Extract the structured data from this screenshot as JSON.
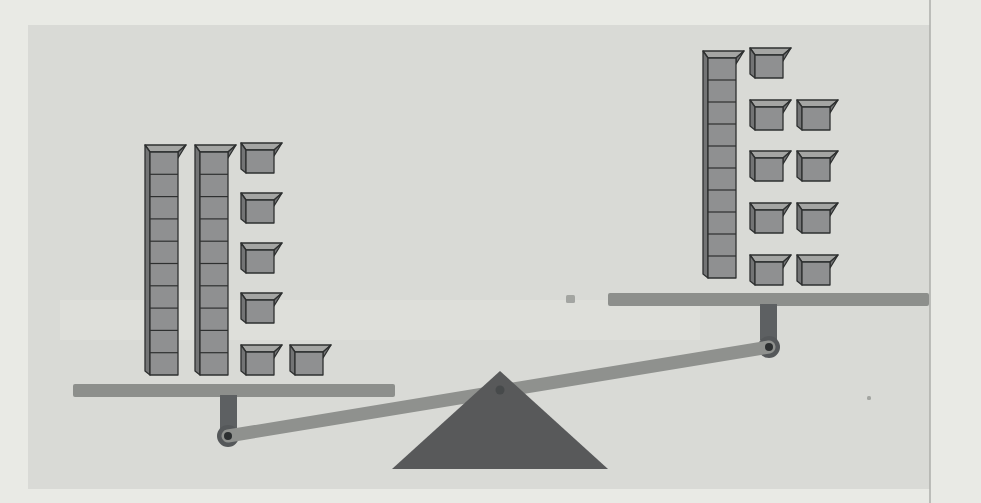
{
  "illustration": {
    "kind": "pan-balance-with-base-ten-blocks",
    "tilt": "left-side-down",
    "units_per_rod": 10,
    "left_pan": {
      "tens_rods": 2,
      "unit_cubes": 6,
      "total_units": 26
    },
    "right_pan": {
      "tens_rods": 1,
      "unit_cubes": 9,
      "total_units": 19
    }
  },
  "colors": {
    "outer_bg": "#e9eae5",
    "page_bg": "#d9dad6",
    "divider": "#acaeaa",
    "block_face": "#8f9091",
    "block_top": "#a4a5a3",
    "block_side": "#737475",
    "block_edge": "#2e3030",
    "platform": "#8d8f8c",
    "beam": "#8f918e",
    "post": "#5d6062",
    "pivot": "#55585a",
    "pivot_dot": "#2c2f30",
    "fulcrum": "#58595a",
    "fulcrum_dot": "#474a4b",
    "artifact": "#e4e5e1",
    "speck": "#999b98"
  },
  "geometry": {
    "canvas": {
      "w": 981,
      "h": 503
    },
    "page": {
      "inner": [
        28,
        25,
        902,
        464
      ],
      "divider_x": 930,
      "artifact_band": [
        60,
        300,
        640,
        40
      ],
      "specks": [
        [
          566,
          295,
          9,
          8
        ],
        [
          867,
          396,
          4,
          4
        ]
      ]
    },
    "cube": {
      "w": 28,
      "one_h": 23,
      "top_dx": 8,
      "top_dy": 7,
      "side_dx": 5,
      "side_dy": 4
    },
    "left_blocks": {
      "rod_seg_h": 22.3,
      "rods": [
        [
          150,
          152
        ],
        [
          200,
          152
        ]
      ],
      "ones": [
        [
          246,
          150
        ],
        [
          246,
          200
        ],
        [
          246,
          250
        ],
        [
          246,
          300
        ],
        [
          246,
          352
        ],
        [
          295,
          352
        ]
      ]
    },
    "right_blocks": {
      "rod_seg_h": 22,
      "rods": [
        [
          708,
          58
        ]
      ],
      "ones": [
        [
          755,
          55
        ],
        [
          755,
          107
        ],
        [
          755,
          158
        ],
        [
          755,
          210
        ],
        [
          755,
          262
        ],
        [
          802,
          107
        ],
        [
          802,
          158
        ],
        [
          802,
          210
        ],
        [
          802,
          262
        ]
      ]
    },
    "scale": {
      "left_platform": [
        73,
        384,
        322,
        13
      ],
      "right_platform": [
        608,
        293,
        321,
        13
      ],
      "left_post": [
        220,
        395,
        17,
        34
      ],
      "right_post": [
        760,
        304,
        17,
        36
      ],
      "left_pivot": [
        228,
        436,
        11
      ],
      "right_pivot": [
        769,
        347,
        11
      ],
      "beam": [
        228,
        436,
        769,
        347,
        13
      ],
      "fulcrum": {
        "apex": [
          500,
          371
        ],
        "base": [
          [
            392,
            469
          ],
          [
            608,
            469
          ]
        ],
        "dot": [
          500,
          390,
          4.5
        ]
      }
    }
  }
}
